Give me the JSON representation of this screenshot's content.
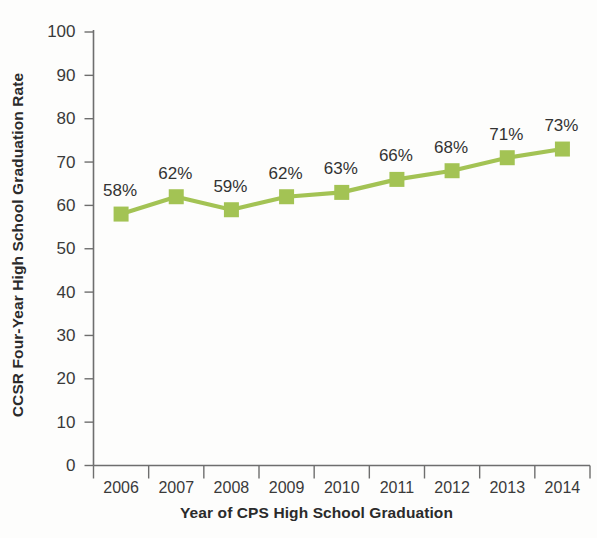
{
  "chart_data": {
    "type": "line",
    "title": "",
    "xlabel": "Year of CPS High School Graduation",
    "ylabel": "CCSR Four-Year High School Graduation Rate",
    "categories": [
      "2006",
      "2007",
      "2008",
      "2009",
      "2010",
      "2011",
      "2012",
      "2013",
      "2014"
    ],
    "values": [
      58,
      62,
      59,
      62,
      63,
      66,
      68,
      71,
      73
    ],
    "point_labels": [
      "58%",
      "62%",
      "59%",
      "62%",
      "63%",
      "66%",
      "68%",
      "71%",
      "73%"
    ],
    "ylim": [
      0,
      100
    ],
    "y_ticks": [
      0,
      10,
      20,
      30,
      40,
      50,
      60,
      70,
      80,
      90,
      100
    ],
    "y_tick_labels": [
      "0",
      "10",
      "20",
      "30",
      "40",
      "50",
      "60",
      "70",
      "80",
      "90",
      "100"
    ],
    "grid": false,
    "legend": false,
    "legend_position": "none",
    "series_color": "#a3c354",
    "marker": "square",
    "axis_color": "#6e6e6e",
    "text_color": "#333333",
    "background_color": "#fdfdfc"
  }
}
